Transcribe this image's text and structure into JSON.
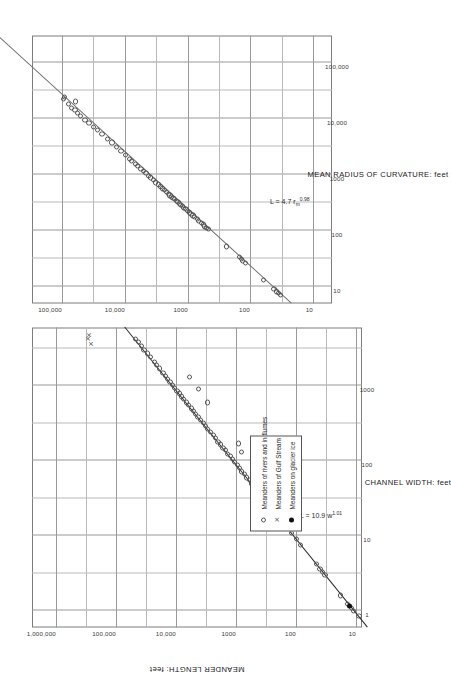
{
  "figure": {
    "background": "#ffffff",
    "line_color": "#6e6e6e",
    "grid_color": "#9a9a9a",
    "marker_color": "#555555"
  },
  "legend": {
    "items": [
      {
        "symbol": "open-circle",
        "label": "Meanders of rivers and in flumes"
      },
      {
        "symbol": "cross",
        "label": "Meanders of Gulf Stream"
      },
      {
        "symbol": "filled-circle",
        "label": "Meanders on glacier ice"
      }
    ]
  },
  "chart_data": [
    {
      "id": "upper",
      "type": "scatter",
      "title": "",
      "xlabel": "MEAN RADIUS OF CURVATURE:  feet",
      "ylabel": "MEANDER LENGTH:  feet",
      "xscale": "log",
      "yscale": "log",
      "xlim": [
        5,
        300000
      ],
      "ylim": [
        5,
        300000
      ],
      "xticks": [
        10,
        100,
        1000,
        10000,
        100000
      ],
      "xticklabels": [
        "10",
        "100",
        "1000",
        "10,000",
        "100,000"
      ],
      "yticks": [
        10,
        100,
        1000,
        10000,
        100000
      ],
      "yticklabels": [
        "10",
        "100",
        "1000",
        "10,000",
        "100,000"
      ],
      "grid": true,
      "annotation": "L = 4.7 r_m^0.98",
      "annotation_html": "L = 4.7 r<sub>m</sub><sup>0.98</sup>",
      "fit": {
        "intercept": 4.7,
        "exponent": 0.98
      },
      "series": [
        {
          "name": "Meanders of rivers and in flumes",
          "symbol": "open-circle",
          "points": [
            [
              7.0,
              33
            ],
            [
              7.6,
              36
            ],
            [
              8.2,
              38
            ],
            [
              9.0,
              42
            ],
            [
              13,
              62
            ],
            [
              26,
              120
            ],
            [
              29,
              132
            ],
            [
              31,
              140
            ],
            [
              34,
              150
            ],
            [
              52,
              240
            ],
            [
              105,
              470
            ],
            [
              112,
              500
            ],
            [
              118,
              530
            ],
            [
              128,
              560
            ],
            [
              135,
              600
            ],
            [
              150,
              660
            ],
            [
              160,
              700
            ],
            [
              172,
              770
            ],
            [
              185,
              820
            ],
            [
              195,
              880
            ],
            [
              210,
              930
            ],
            [
              225,
              1000
            ],
            [
              240,
              1060
            ],
            [
              255,
              1150
            ],
            [
              270,
              1200
            ],
            [
              285,
              1280
            ],
            [
              300,
              1350
            ],
            [
              320,
              1420
            ],
            [
              340,
              1500
            ],
            [
              360,
              1600
            ],
            [
              380,
              1700
            ],
            [
              400,
              1800
            ],
            [
              420,
              1900
            ],
            [
              450,
              2000
            ],
            [
              480,
              2150
            ],
            [
              520,
              2300
            ],
            [
              560,
              2500
            ],
            [
              610,
              2700
            ],
            [
              660,
              2900
            ],
            [
              720,
              3200
            ],
            [
              800,
              3500
            ],
            [
              880,
              3900
            ],
            [
              950,
              4200
            ],
            [
              1050,
              4600
            ],
            [
              1150,
              5100
            ],
            [
              1250,
              5500
            ],
            [
              1400,
              6200
            ],
            [
              1550,
              6800
            ],
            [
              1750,
              7700
            ],
            [
              1900,
              8400
            ],
            [
              2200,
              9700
            ],
            [
              2600,
              11500
            ],
            [
              3100,
              13500
            ],
            [
              3700,
              16000
            ],
            [
              4300,
              19000
            ],
            [
              5200,
              23000
            ],
            [
              6100,
              27000
            ],
            [
              7000,
              31000
            ],
            [
              8200,
              37000
            ],
            [
              9500,
              43000
            ],
            [
              11000,
              50000
            ],
            [
              12500,
              57000
            ],
            [
              14000,
              62000
            ],
            [
              15500,
              70000
            ],
            [
              18000,
              78000
            ],
            [
              20000,
              60000
            ],
            [
              22000,
              95000
            ],
            [
              24000,
              90000
            ]
          ]
        }
      ]
    },
    {
      "id": "lower",
      "type": "scatter",
      "title": "",
      "xlabel": "CHANNEL WIDTH:  feet",
      "ylabel": "MEANDER LENGTH:  feet",
      "xscale": "log",
      "yscale": "log",
      "xlim": [
        0.6,
        6000
      ],
      "ylim": [
        8,
        2500000
      ],
      "xticks": [
        1,
        10,
        100,
        1000
      ],
      "xticklabels": [
        "1",
        "10",
        "100",
        "1000"
      ],
      "yticks": [
        10,
        100,
        1000,
        10000,
        100000,
        1000000
      ],
      "yticklabels": [
        "10",
        "100",
        "1000",
        "10,000",
        "100,000",
        "1,000,000"
      ],
      "grid": true,
      "annotation": "L = 10.9 w^1.01",
      "annotation_html": "L = 10.9 w<sup>1.01</sup>",
      "fit": {
        "intercept": 10.9,
        "exponent": 1.01
      },
      "series": [
        {
          "name": "Meanders of rivers and in flumes",
          "symbol": "open-circle",
          "points": [
            [
              0.85,
              9
            ],
            [
              1.0,
              11
            ],
            [
              1.1,
              12
            ],
            [
              1.25,
              14
            ],
            [
              1.6,
              18
            ],
            [
              3.0,
              33
            ],
            [
              3.3,
              36
            ],
            [
              3.6,
              40
            ],
            [
              4.2,
              46
            ],
            [
              7.5,
              85
            ],
            [
              9.0,
              100
            ],
            [
              11,
              120
            ],
            [
              13,
              145
            ],
            [
              15,
              170
            ],
            [
              18,
              200
            ],
            [
              21,
              230
            ],
            [
              24,
              260
            ],
            [
              28,
              300
            ],
            [
              31,
              340
            ],
            [
              35,
              380
            ],
            [
              40,
              440
            ],
            [
              45,
              490
            ],
            [
              50,
              550
            ],
            [
              55,
              600
            ],
            [
              60,
              670
            ],
            [
              66,
              730
            ],
            [
              72,
              800
            ],
            [
              80,
              880
            ],
            [
              88,
              960
            ],
            [
              96,
              1050
            ],
            [
              105,
              1150
            ],
            [
              115,
              1250
            ],
            [
              125,
              1400
            ],
            [
              138,
              1500
            ],
            [
              150,
              1650
            ],
            [
              165,
              1800
            ],
            [
              180,
              2000
            ],
            [
              200,
              2200
            ],
            [
              220,
              2400
            ],
            [
              240,
              2700
            ],
            [
              265,
              2950
            ],
            [
              290,
              3200
            ],
            [
              320,
              3500
            ],
            [
              350,
              3900
            ],
            [
              385,
              4300
            ],
            [
              420,
              4700
            ],
            [
              460,
              5100
            ],
            [
              500,
              5600
            ],
            [
              550,
              6200
            ],
            [
              600,
              6700
            ],
            [
              660,
              7400
            ],
            [
              720,
              8000
            ],
            [
              790,
              8800
            ],
            [
              860,
              9600
            ],
            [
              940,
              10500
            ],
            [
              1030,
              11500
            ],
            [
              1130,
              12600
            ],
            [
              1240,
              13800
            ],
            [
              1360,
              15000
            ],
            [
              1500,
              16500
            ],
            [
              1700,
              19000
            ],
            [
              1900,
              21000
            ],
            [
              2100,
              23000
            ],
            [
              2400,
              27000
            ],
            [
              2700,
              30000
            ],
            [
              3000,
              34000
            ],
            [
              3400,
              38000
            ],
            [
              3800,
              42000
            ],
            [
              4200,
              47000
            ],
            [
              600,
              3000
            ],
            [
              900,
              4200
            ],
            [
              1300,
              6000
            ],
            [
              170,
              900
            ],
            [
              48,
              370
            ],
            [
              130,
              800
            ]
          ]
        },
        {
          "name": "Meanders of Gulf Stream",
          "symbol": "cross",
          "points": [
            [
              3600,
              260000
            ],
            [
              4200,
              300000
            ],
            [
              4700,
              290000
            ]
          ]
        },
        {
          "name": "Meanders on glacier ice",
          "symbol": "filled-circle",
          "points": [
            [
              1.15,
              13
            ]
          ]
        }
      ]
    }
  ]
}
